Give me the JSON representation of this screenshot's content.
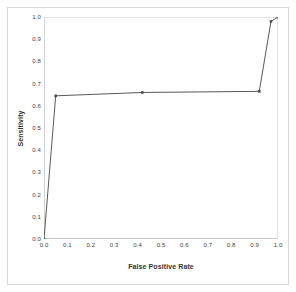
{
  "chart_data": {
    "type": "line",
    "title": "",
    "xlabel": "False Positive Rate",
    "ylabel": "Sensitivity",
    "xlim": [
      0.0,
      1.0
    ],
    "ylim": [
      0.0,
      1.0
    ],
    "xticks": [
      "0.0",
      "0.1",
      "0.2",
      "0.3",
      "0.4",
      "0.5",
      "0.6",
      "0.7",
      "0.8",
      "0.9",
      "1.0"
    ],
    "yticks": [
      "0.0",
      "0.1",
      "0.2",
      "0.3",
      "0.4",
      "0.5",
      "0.6",
      "0.7",
      "0.8",
      "0.9",
      "1.0"
    ],
    "xtick_values": [
      0.0,
      0.1,
      0.2,
      0.3,
      0.4,
      0.5,
      0.6,
      0.7,
      0.8,
      0.9,
      1.0
    ],
    "ytick_values": [
      0.0,
      0.1,
      0.2,
      0.3,
      0.4,
      0.5,
      0.6,
      0.7,
      0.8,
      0.9,
      1.0
    ],
    "grid": false,
    "legend": "none",
    "series": [
      {
        "name": "ROC curve",
        "color": "#595959",
        "marker": "square",
        "x": [
          0.0,
          0.05,
          0.42,
          0.92,
          0.97,
          1.0
        ],
        "y": [
          0.0,
          0.645,
          0.66,
          0.665,
          0.98,
          1.0
        ]
      }
    ]
  },
  "figure": {
    "background_color": "#ffffff",
    "border_color": "#d9d9d9",
    "axis_color": "#d0d0d0",
    "line_color": "#595959",
    "marker_color": "#4d4d4d",
    "tick_text_color": "#404040",
    "axis_title_color": "#333333"
  }
}
